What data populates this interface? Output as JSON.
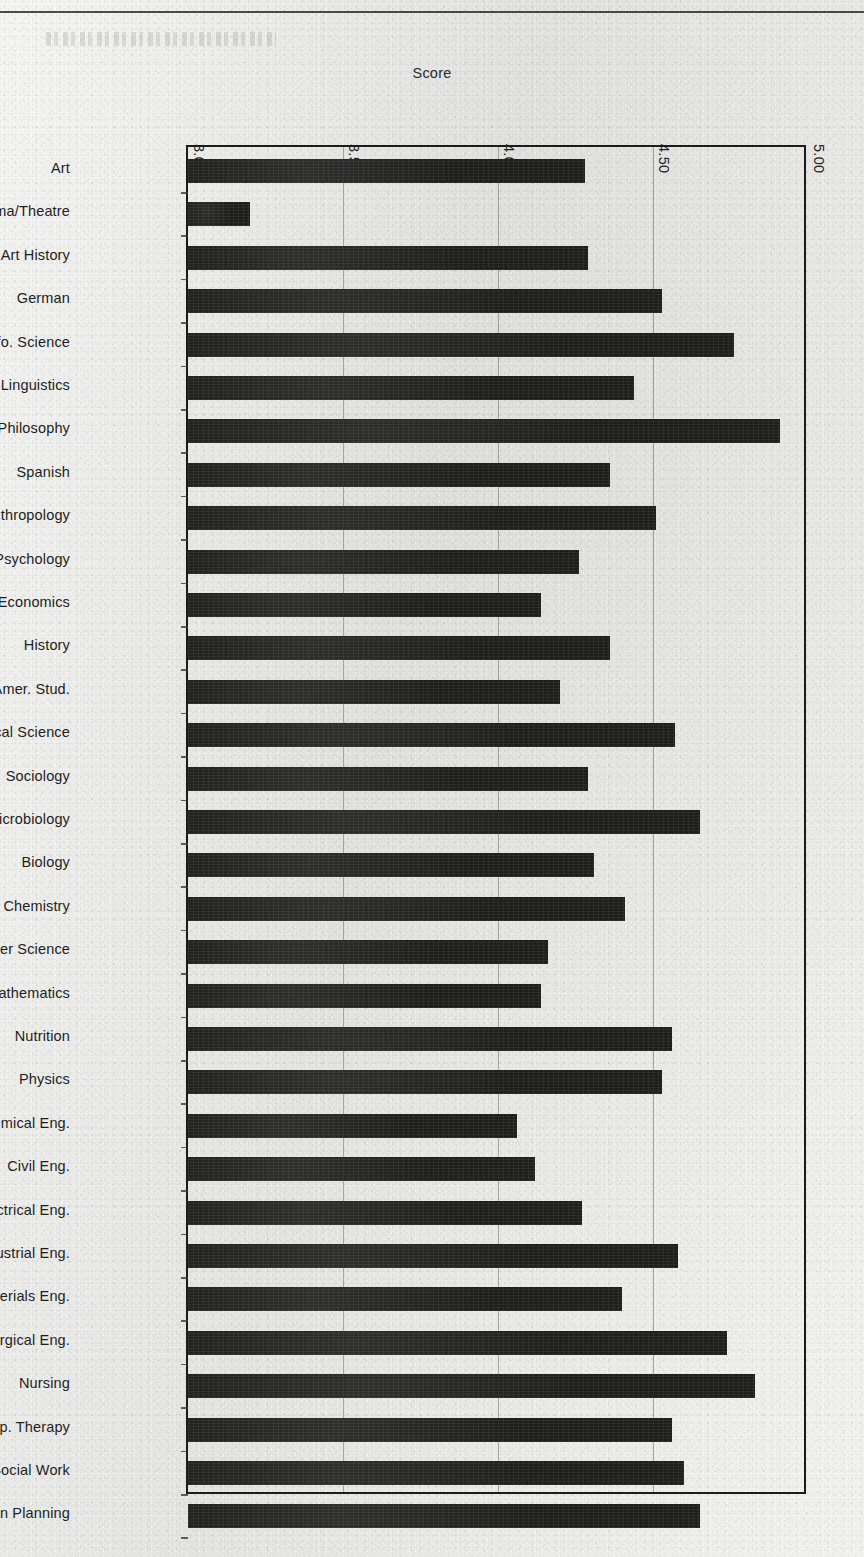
{
  "axis": {
    "title": "Score",
    "tick_labels": [
      "3.00",
      "3.50",
      "4.00",
      "4.50",
      "5.00"
    ]
  },
  "chart_data": {
    "type": "bar",
    "orientation": "horizontal",
    "title": "",
    "xlabel": "Score",
    "ylabel": "",
    "xlim": [
      3.0,
      5.0
    ],
    "xticks": [
      3.0,
      3.5,
      4.0,
      4.5,
      5.0
    ],
    "grid": true,
    "legend": "none",
    "bar_color": "#1f1f1d",
    "background_color": "#e9e9e7",
    "categories": [
      "Art",
      "Drama/Theatre",
      "Art History",
      "German",
      "Info. Science",
      "Linguistics",
      "Philosophy",
      "Spanish",
      "Anthropology",
      "Child Psychology",
      "Economics",
      "History",
      "Latin Amer. Stud.",
      "Political Science",
      "Sociology",
      "Microbiology",
      "Biology",
      "Chemistry",
      "Computer Science",
      "Mathematics",
      "Nutrition",
      "Physics",
      "Chemical Eng.",
      "Civil Eng.",
      "Electrical Eng.",
      "Industrial Eng.",
      "Materials Eng.",
      "Metallurgical Eng.",
      "Nursing",
      "Occup. Therapy",
      "Social Work",
      "Urban Planning"
    ],
    "values": [
      4.28,
      3.2,
      4.29,
      4.53,
      4.76,
      4.44,
      4.91,
      4.36,
      4.51,
      4.26,
      4.14,
      4.36,
      4.2,
      4.57,
      4.29,
      4.65,
      4.31,
      4.41,
      4.16,
      4.14,
      4.56,
      4.53,
      4.06,
      4.12,
      4.27,
      4.58,
      4.4,
      4.74,
      4.83,
      4.56,
      4.6,
      4.65
    ]
  }
}
